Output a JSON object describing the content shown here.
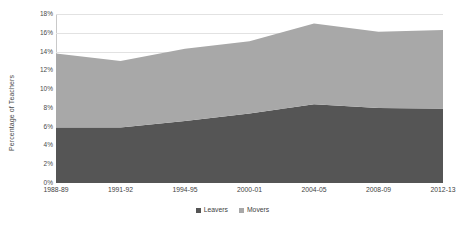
{
  "chart_data": {
    "type": "area",
    "stacked": true,
    "title": "",
    "subtitle": "",
    "xlabel": "",
    "ylabel": "Percentage of Teachers",
    "categories": [
      "1988-89",
      "1991-92",
      "1994-95",
      "2000-01",
      "2004-05",
      "2008-09",
      "2012-13"
    ],
    "series": [
      {
        "name": "Leavers",
        "color": "#555555",
        "values": [
          5.9,
          5.9,
          6.6,
          7.4,
          8.4,
          8.0,
          7.9
        ]
      },
      {
        "name": "Movers",
        "color": "#a8a8a8",
        "values": [
          7.9,
          7.1,
          7.7,
          7.7,
          8.6,
          8.1,
          8.4
        ]
      }
    ],
    "totals": [
      13.8,
      13.0,
      14.3,
      15.1,
      17.0,
      16.1,
      16.3
    ],
    "ylim": [
      0,
      18
    ],
    "ytick_step": 2,
    "ytick_labels": [
      "0%",
      "2%",
      "4%",
      "6%",
      "8%",
      "10%",
      "12%",
      "14%",
      "16%",
      "18%"
    ],
    "ytick_values": [
      0,
      2,
      4,
      6,
      8,
      10,
      12,
      14,
      16,
      18
    ],
    "grid": true,
    "grid_axis": "y",
    "legend_position": "bottom",
    "legend_entries": [
      "Leavers",
      "Movers"
    ]
  },
  "axis": {
    "y_title": "Percentage of Teachers"
  },
  "colors": {
    "leavers": "#555555",
    "movers": "#a8a8a8",
    "gridline": "#e2e2e2",
    "axis_line": "#c9c9c9",
    "background": "#ffffff",
    "text": "#3f3f3f"
  }
}
